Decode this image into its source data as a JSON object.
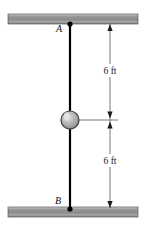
{
  "figure": {
    "background_color": "#ffffff",
    "width": 145,
    "height": 225
  },
  "supports": {
    "top": {
      "name": "upper-support-beam",
      "x": 8,
      "y": 14,
      "width": 130,
      "height": 10,
      "fill_light": "#d8d8d8",
      "fill_dark": "#8e8e8e",
      "border_color": "#5a5a5a"
    },
    "bottom": {
      "name": "lower-support-beam",
      "x": 8,
      "y": 207,
      "width": 130,
      "height": 10,
      "fill_light": "#d8d8d8",
      "fill_dark": "#8e8e8e",
      "border_color": "#5a5a5a"
    }
  },
  "rod": {
    "name": "vertical-rod",
    "x": 70,
    "y_top": 24,
    "y_bottom": 209,
    "color": "#000000",
    "thickness": 2.2
  },
  "points": [
    {
      "id": "A",
      "label": "A",
      "x": 70,
      "y": 24,
      "label_x": 62,
      "label_y": 32,
      "dot_radius": 2.6,
      "color": "#000000"
    },
    {
      "id": "B",
      "label": "B",
      "x": 70,
      "y": 209,
      "label_x": 61,
      "label_y": 204,
      "dot_radius": 2.6,
      "color": "#000000"
    }
  ],
  "collar": {
    "name": "sliding-collar-ball",
    "cx": 70,
    "cy": 120,
    "r": 9,
    "fill": "#a8a8a8",
    "highlight": "#d5d5d5",
    "stroke": "#3c3c3c",
    "stroke_width": 1.2
  },
  "dimensions": {
    "line_x": 110,
    "line_color": "#555555",
    "line_width": 0.8,
    "extension": {
      "name": "collar-extension-line",
      "x1": 79,
      "x2": 118,
      "y": 120
    },
    "segments": [
      {
        "name": "dimension-upper",
        "label": "6 ft",
        "y_start": 24,
        "y_end": 120,
        "label_x": 110,
        "label_y": 73,
        "arrow_top": true,
        "arrow_bottom": true
      },
      {
        "name": "dimension-lower",
        "label": "6 ft",
        "y_start": 120,
        "y_end": 208,
        "label_x": 110,
        "label_y": 163,
        "arrow_top": true,
        "arrow_bottom": true
      }
    ]
  }
}
